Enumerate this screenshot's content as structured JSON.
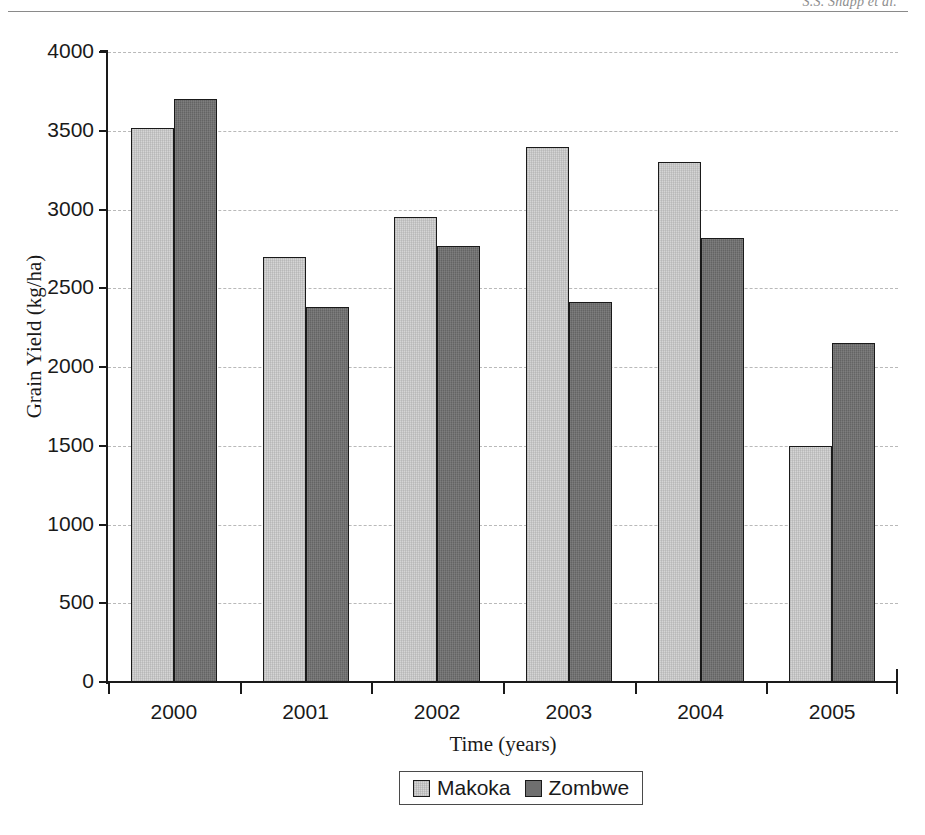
{
  "page": {
    "running_head": "S.S. Snapp et al."
  },
  "chart_data": {
    "type": "bar",
    "title": "",
    "xlabel": "Time (years)",
    "ylabel": "Grain Yield (kg/ha)",
    "categories": [
      "2000",
      "2001",
      "2002",
      "2003",
      "2004",
      "2005"
    ],
    "series": [
      {
        "name": "Makoka",
        "color": "#d5d5d5",
        "values": [
          3520,
          2700,
          2950,
          3400,
          3300,
          1500
        ]
      },
      {
        "name": "Zombwe",
        "color": "#6f6f6f",
        "values": [
          3700,
          2380,
          2770,
          2410,
          2820,
          2150
        ]
      }
    ],
    "ylim": [
      0,
      4000
    ],
    "ytick_labels": [
      "4000",
      "3500",
      "3000",
      "2500",
      "2000",
      "1500",
      "1000",
      "500",
      "0"
    ],
    "ytick_values": [
      4000,
      3500,
      3000,
      2500,
      2000,
      1500,
      1000,
      500,
      0
    ],
    "grid": true,
    "grid_style": "dashed",
    "legend_position": "bottom-center"
  }
}
